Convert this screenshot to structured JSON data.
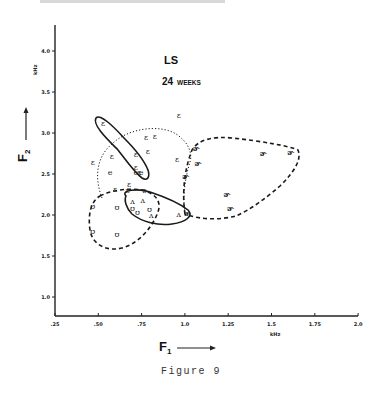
{
  "figure": {
    "caption": "Figure 9",
    "speaker": "LS",
    "age_label_number": "24",
    "age_label_unit": "WEEKS"
  },
  "chart_data": {
    "type": "scatter",
    "title": "LS 24 WEEKS",
    "xlabel": "F1",
    "xunit": "kHz",
    "ylabel": "F2",
    "yunit": "kHz",
    "xlim": [
      0.25,
      2.0
    ],
    "ylim": [
      1.0,
      4.0
    ],
    "x_ticks": [
      ".25",
      ".50",
      ".75",
      "1.0",
      "1.25",
      "1.5",
      "1.75",
      "2.0"
    ],
    "y_ticks": [
      "1.0",
      "1.5",
      "2.0",
      "2.5",
      "3.0",
      "3.5",
      "4.0"
    ],
    "grid": false,
    "legend": null,
    "series": [
      {
        "name": "ɛ",
        "symbol": "ε",
        "outline": "dotted",
        "points": [
          [
            0.53,
            3.12
          ],
          [
            0.78,
            2.95
          ],
          [
            0.83,
            2.96
          ],
          [
            0.72,
            2.75
          ],
          [
            0.79,
            2.78
          ],
          [
            0.97,
            3.22
          ],
          [
            0.96,
            2.68
          ],
          [
            0.47,
            2.65
          ],
          [
            0.58,
            2.72
          ],
          [
            0.68,
            2.38
          ],
          [
            0.74,
            2.52
          ],
          [
            0.72,
            2.58
          ],
          [
            0.6,
            2.32
          ],
          [
            0.67,
            2.3
          ],
          [
            0.77,
            2.31
          ]
        ]
      },
      {
        "name": "e",
        "symbol": "e",
        "outline": "solid",
        "points": [
          [
            0.57,
            2.52
          ],
          [
            0.72,
            2.53
          ],
          [
            0.75,
            2.53
          ]
        ]
      },
      {
        "name": "ɚ",
        "symbol": "ɚ",
        "outline": "dashed",
        "points": [
          [
            1.07,
            2.82
          ],
          [
            1.46,
            2.76
          ],
          [
            1.62,
            2.77
          ],
          [
            1.08,
            2.64
          ],
          [
            1.01,
            2.48
          ],
          [
            1.25,
            2.26
          ],
          [
            1.27,
            2.08
          ],
          [
            1.02,
            2.03
          ]
        ]
      },
      {
        "name": "ʊ",
        "symbol": "ʊ",
        "outline": "dashed",
        "points": [
          [
            0.47,
            2.11
          ],
          [
            0.61,
            2.1
          ],
          [
            0.7,
            2.08
          ],
          [
            0.73,
            2.04
          ],
          [
            0.47,
            1.8
          ],
          [
            0.61,
            1.77
          ],
          [
            0.8,
            2.07
          ]
        ]
      },
      {
        "name": "ʌ",
        "symbol": "ʌ",
        "outline": "solid",
        "points": [
          [
            0.7,
            2.17
          ],
          [
            0.76,
            2.18
          ],
          [
            0.81,
            2.0
          ],
          [
            0.97,
            2.01
          ]
        ]
      }
    ],
    "outlines": [
      {
        "id": "e-ellipse",
        "style": "solid",
        "encloses": "upper-left elongated region F1 0.5-0.8, F2 2.4-3.2"
      },
      {
        "id": "open-ellipse",
        "style": "solid",
        "encloses": "F1 0.68-1.05, F2 1.9-2.3"
      },
      {
        "id": "eps-circle",
        "style": "dotted",
        "encloses": "F1 0.45-1.05, F2 2.0-3.0"
      },
      {
        "id": "er-region",
        "style": "dashed",
        "encloses": "F1 1.0-1.65, F2 1.95-2.9"
      },
      {
        "id": "u-region",
        "style": "dashed",
        "encloses": "F1 0.44-0.95, F2 1.55-2.2"
      }
    ]
  }
}
